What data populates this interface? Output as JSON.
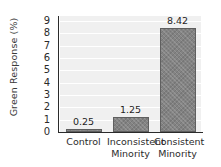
{
  "chart_data": {
    "type": "bar",
    "title": "",
    "xlabel": "",
    "ylabel": "Green Response (%)",
    "categories": [
      "Control",
      "Inconsistent Minority",
      "Consistent Minority"
    ],
    "category_lines": [
      [
        "Control"
      ],
      [
        "Inconsistent",
        "Minority"
      ],
      [
        "Consistent",
        "Minority"
      ]
    ],
    "values": [
      0.25,
      1.25,
      8.42
    ],
    "value_labels": [
      "0.25",
      "1.25",
      "8.42"
    ],
    "ylim": [
      0,
      9.4
    ],
    "yticks": [
      0,
      1,
      2,
      3,
      4,
      5,
      6,
      7,
      8,
      9
    ],
    "ytick_labels": [
      "0",
      "1",
      "2",
      "3",
      "4",
      "5",
      "6",
      "7",
      "8",
      "9"
    ],
    "grid": true,
    "grid_axis": "y",
    "grid_color": "#ffffff",
    "plot_background": "#f0f0f0",
    "bar_color": "#838383",
    "bar_edge_color": "#5f5f5f",
    "bar_hatch": "crosshatch",
    "legend": null,
    "legend_position": "none"
  }
}
